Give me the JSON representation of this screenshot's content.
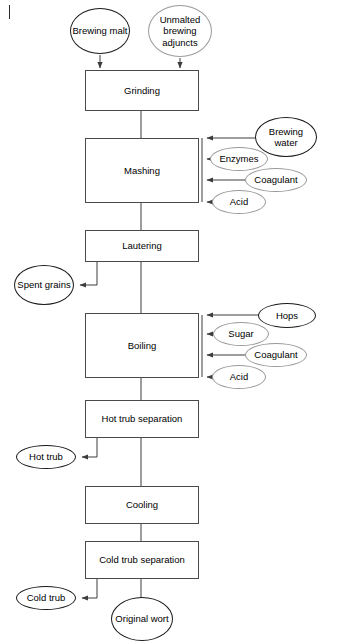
{
  "diagram": {
    "type": "process-flowchart",
    "orientation": "vertical top-to-bottom",
    "process_steps": [
      {
        "id": "grinding",
        "label": "Grinding",
        "x": 85,
        "y": 70,
        "w": 114,
        "h": 41
      },
      {
        "id": "mashing",
        "label": "Mashing",
        "x": 85,
        "y": 138,
        "w": 114,
        "h": 65
      },
      {
        "id": "lautering",
        "label": "Lautering",
        "x": 85,
        "y": 230,
        "w": 114,
        "h": 32
      },
      {
        "id": "boiling",
        "label": "Boiling",
        "x": 85,
        "y": 313,
        "w": 114,
        "h": 65
      },
      {
        "id": "hot-trub-separation",
        "label": "Hot trub separation",
        "x": 85,
        "y": 400,
        "w": 114,
        "h": 38
      },
      {
        "id": "cooling",
        "label": "Cooling",
        "x": 85,
        "y": 486,
        "w": 114,
        "h": 38
      },
      {
        "id": "cold-trub-separation",
        "label": "Cold trub separation",
        "x": 85,
        "y": 541,
        "w": 114,
        "h": 38
      }
    ],
    "inputs_top": [
      {
        "id": "brewing-malt",
        "label": "Brewing malt",
        "style": "solid",
        "x": 70,
        "y": 8,
        "w": 60,
        "h": 46
      },
      {
        "id": "unmalted-brewing-adjuncts",
        "label": "Unmalted brewing adjuncts",
        "style": "light",
        "x": 148,
        "y": 5,
        "w": 64,
        "h": 52
      }
    ],
    "inputs_mashing": [
      {
        "id": "brewing-water",
        "label": "Brewing water",
        "style": "solid",
        "x": 255,
        "y": 117,
        "w": 62,
        "h": 40
      },
      {
        "id": "enzymes-mashing",
        "label": "Enzymes",
        "style": "light",
        "x": 210,
        "y": 147,
        "w": 58,
        "h": 24
      },
      {
        "id": "coagulant-mashing",
        "label": "Coagulant",
        "style": "light",
        "x": 245,
        "y": 168,
        "w": 62,
        "h": 24
      },
      {
        "id": "acid-mashing",
        "label": "Acid",
        "style": "light",
        "x": 212,
        "y": 190,
        "w": 54,
        "h": 24
      }
    ],
    "inputs_boiling": [
      {
        "id": "hops",
        "label": "Hops",
        "style": "solid",
        "x": 258,
        "y": 303,
        "w": 58,
        "h": 25
      },
      {
        "id": "sugar",
        "label": "Sugar",
        "style": "light",
        "x": 213,
        "y": 322,
        "w": 56,
        "h": 24
      },
      {
        "id": "coagulant-boiling",
        "label": "Coagulant",
        "style": "light",
        "x": 245,
        "y": 343,
        "w": 62,
        "h": 24
      },
      {
        "id": "acid-boiling",
        "label": "Acid",
        "style": "light",
        "x": 212,
        "y": 365,
        "w": 54,
        "h": 24
      }
    ],
    "outputs_side": [
      {
        "id": "spent-grains",
        "label": "Spent grains",
        "style": "solid",
        "x": 14,
        "y": 265,
        "w": 60,
        "h": 40
      },
      {
        "id": "hot-trub",
        "label": "Hot trub",
        "style": "solid",
        "x": 16,
        "y": 445,
        "w": 60,
        "h": 24
      },
      {
        "id": "cold-trub",
        "label": "Cold trub",
        "style": "solid",
        "x": 16,
        "y": 586,
        "w": 60,
        "h": 24
      }
    ],
    "outputs_final": [
      {
        "id": "original-wort",
        "label": "Original wort",
        "style": "solid",
        "x": 111,
        "y": 597,
        "w": 62,
        "h": 44
      }
    ],
    "colors": {
      "box_border": "#4a4a4a",
      "ellipse_solid_border": "#1a1a1a",
      "ellipse_light_border": "#9a9a9a",
      "arrow": "#3c3c3c",
      "background": "#ffffff",
      "text": "#000000"
    }
  }
}
